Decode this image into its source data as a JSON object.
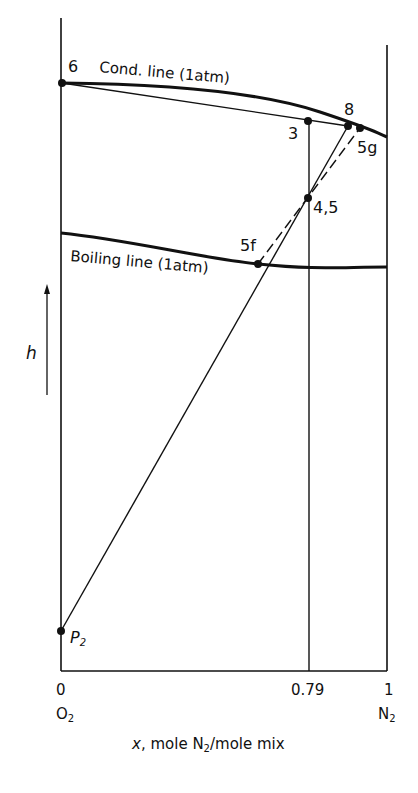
{
  "diagram": {
    "type": "enthalpy-concentration diagram",
    "y_axis": {
      "label": "h"
    },
    "x_axis": {
      "label_prefix": "x",
      "label_text": ", mole N",
      "label_sub": "2",
      "label_suffix": "/mole mix",
      "ticks": [
        "0",
        "0.79",
        "1"
      ],
      "end_labels": {
        "left": "O",
        "left_sub": "2",
        "right": "N",
        "right_sub": "2"
      }
    },
    "curves": {
      "condensation": "Cond. line (1atm)",
      "boiling": "Boiling line (1atm)"
    },
    "points": [
      {
        "id": "6",
        "label": "6"
      },
      {
        "id": "3",
        "label": "3"
      },
      {
        "id": "8",
        "label": "8"
      },
      {
        "id": "5g",
        "label": "5g"
      },
      {
        "id": "4,5",
        "label": "4,5"
      },
      {
        "id": "5f",
        "label": "5f"
      },
      {
        "id": "P2",
        "label": "P",
        "label_sub": "2"
      }
    ]
  }
}
